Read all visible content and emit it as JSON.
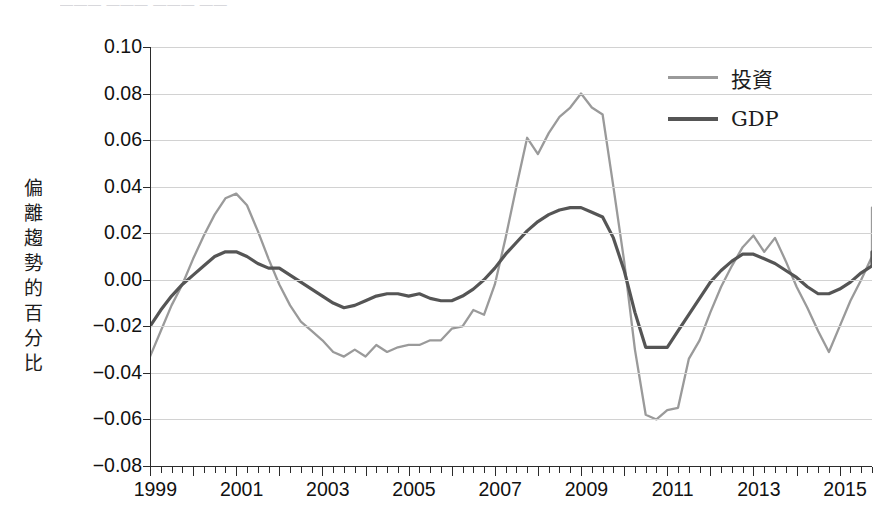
{
  "page": {
    "top_remnant_text": "———  ——— ———  ——"
  },
  "axis": {
    "y_title": "偏離趨勢的百分比",
    "y_ticks": [
      "0.10",
      "0.08",
      "0.06",
      "0.04",
      "0.02",
      "0.00",
      "−0.02",
      "−0.04",
      "−0.06",
      "−0.08"
    ],
    "x_labels": [
      "1999",
      "2001",
      "2003",
      "2005",
      "2007",
      "2009",
      "2011",
      "2013",
      "2015"
    ]
  },
  "legend": {
    "items": [
      {
        "label": "投資",
        "color": "#9a9a9a"
      },
      {
        "label": "GDP",
        "color": "#555555"
      }
    ]
  },
  "chart_data": {
    "type": "line",
    "title": "",
    "xlabel": "",
    "ylabel": "偏離趨勢的百分比",
    "ylim": [
      -0.08,
      0.1
    ],
    "ytick_step": 0.02,
    "xlim": [
      1999.0,
      2015.75
    ],
    "grid": true,
    "legend_position": "top-right",
    "x_tick_labels": [
      "1999",
      "2001",
      "2003",
      "2005",
      "2007",
      "2009",
      "2011",
      "2013",
      "2015"
    ],
    "x_minor_ticks": "quarterly",
    "x": [
      1999.0,
      1999.25,
      1999.5,
      1999.75,
      2000.0,
      2000.25,
      2000.5,
      2000.75,
      2001.0,
      2001.25,
      2001.5,
      2001.75,
      2002.0,
      2002.25,
      2002.5,
      2002.75,
      2003.0,
      2003.25,
      2003.5,
      2003.75,
      2004.0,
      2004.25,
      2004.5,
      2004.75,
      2005.0,
      2005.25,
      2005.5,
      2005.75,
      2006.0,
      2006.25,
      2006.5,
      2006.75,
      2007.0,
      2007.25,
      2007.5,
      2007.75,
      2008.0,
      2008.25,
      2008.5,
      2008.75,
      2009.0,
      2009.25,
      2009.5,
      2009.75,
      2010.0,
      2010.25,
      2010.5,
      2010.75,
      2011.0,
      2011.25,
      2011.5,
      2011.75,
      2012.0,
      2012.25,
      2012.5,
      2012.75,
      2013.0,
      2013.25,
      2013.5,
      2013.75,
      2014.0,
      2014.25,
      2014.5,
      2014.75,
      2015.0,
      2015.25,
      2015.5
    ],
    "series": [
      {
        "name": "投資",
        "color": "#9a9a9a",
        "values": [
          -0.033,
          -0.022,
          -0.011,
          -0.002,
          0.009,
          0.019,
          0.028,
          0.035,
          0.037,
          0.032,
          0.021,
          0.009,
          -0.002,
          -0.011,
          -0.018,
          -0.022,
          -0.026,
          -0.031,
          -0.033,
          -0.03,
          -0.033,
          -0.028,
          -0.031,
          -0.029,
          -0.028,
          -0.028,
          -0.026,
          -0.026,
          -0.021,
          -0.02,
          -0.013,
          -0.015,
          -0.002,
          0.018,
          0.04,
          0.061,
          0.054,
          0.063,
          0.07,
          0.074,
          0.08,
          0.074,
          0.071,
          0.04,
          0.008,
          -0.03,
          -0.058,
          -0.06,
          -0.056,
          -0.055,
          -0.034,
          -0.026,
          -0.014,
          -0.003,
          0.006,
          0.014,
          0.019,
          0.012,
          0.018,
          0.008,
          -0.003,
          -0.012,
          -0.022,
          -0.031,
          -0.02,
          -0.009,
          0.0
        ]
      },
      {
        "name": "GDP",
        "color": "#555555",
        "values": [
          -0.02,
          -0.013,
          -0.007,
          -0.002,
          0.002,
          0.006,
          0.01,
          0.012,
          0.012,
          0.01,
          0.007,
          0.005,
          0.005,
          0.002,
          -0.001,
          -0.004,
          -0.007,
          -0.01,
          -0.012,
          -0.011,
          -0.009,
          -0.007,
          -0.006,
          -0.006,
          -0.007,
          -0.006,
          -0.008,
          -0.009,
          -0.009,
          -0.007,
          -0.004,
          0.0,
          0.005,
          0.011,
          0.016,
          0.021,
          0.025,
          0.028,
          0.03,
          0.031,
          0.031,
          0.029,
          0.027,
          0.018,
          0.004,
          -0.014,
          -0.029,
          -0.029,
          -0.029,
          -0.022,
          -0.015,
          -0.008,
          -0.001,
          0.004,
          0.008,
          0.011,
          0.011,
          0.009,
          0.007,
          0.004,
          0.001,
          -0.003,
          -0.006,
          -0.006,
          -0.004,
          -0.001,
          0.003
        ]
      }
    ],
    "series_extra": {
      "投資_tail": [
        0.01,
        0.021,
        0.031,
        0.023
      ],
      "GDP_tail": [
        0.006,
        0.009,
        0.011,
        0.012
      ]
    }
  }
}
